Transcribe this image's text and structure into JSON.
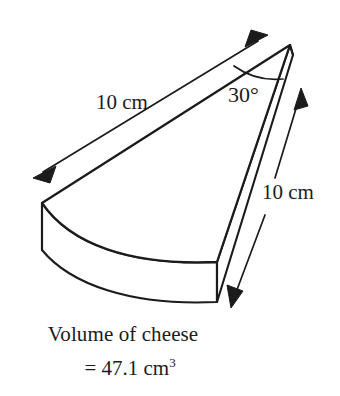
{
  "figure": {
    "subject": "cheese",
    "shape": "circular sector prism (wedge)",
    "stroke_color": "#1b1b1b",
    "fill_color": "#ffffff",
    "background_color": "#ffffff"
  },
  "labels": {
    "radius_left": "10 cm",
    "depth_right": "10 cm",
    "angle": "30°"
  },
  "caption": {
    "line_1": "Volume of cheese",
    "line_2_prefix": "= 47.1 cm",
    "line_2_exponent": "3",
    "value": "47.1",
    "unit": "cm",
    "exponent": "3"
  },
  "annotations": {
    "arrow_radius_label": "double-headed arrow marking the 10 cm radius",
    "arrow_depth_label": "double-headed arrow marking the 10 cm height",
    "angle_arc_label": "arc marking the 30 degree sector angle"
  }
}
